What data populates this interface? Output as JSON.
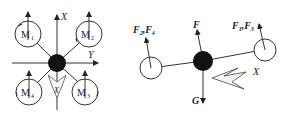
{
  "left_panel": {
    "title": "Top view of quadrotor",
    "axes": {
      "x_label": "X",
      "y_label": "Y"
    },
    "motors": [
      {
        "id": "M1",
        "label": "M",
        "sub": "1"
      },
      {
        "id": "M2",
        "label": "M",
        "sub": "2"
      },
      {
        "id": "M3",
        "label": "M",
        "sub": "3"
      },
      {
        "id": "M4",
        "label": "M",
        "sub": "4"
      }
    ],
    "heading_arrow_label": "X"
  },
  "right_panel": {
    "title": "Side view force diagram",
    "forces": {
      "left": {
        "label": "F",
        "sub1": "2",
        "sep": ",",
        "label2": "F",
        "sub2": "4"
      },
      "center": {
        "label": "F"
      },
      "right": {
        "label": "F",
        "sub1": "1",
        "sep": ",",
        "label2": "F",
        "sub2": "3"
      },
      "gravity": {
        "label": "G"
      }
    },
    "heading_arrow_label": "X"
  },
  "colors": {
    "stroke": "#333333",
    "body": "#111111",
    "fill_light": "#f2f2f2"
  }
}
